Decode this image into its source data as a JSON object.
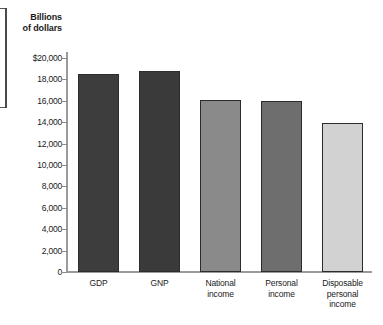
{
  "chart_data": {
    "type": "bar",
    "title": "Billions of dollars",
    "title_line1": "Billions",
    "title_line2": "of dollars",
    "xlabel": "",
    "ylabel": "Billions of dollars",
    "ylim": [
      0,
      20000
    ],
    "grid": false,
    "legend": "none",
    "y_ticks": [
      {
        "value": 20000,
        "label": "$20,000"
      },
      {
        "value": 18000,
        "label": "18,000"
      },
      {
        "value": 16000,
        "label": "16,000"
      },
      {
        "value": 14000,
        "label": "14,000"
      },
      {
        "value": 12000,
        "label": "12,000"
      },
      {
        "value": 10000,
        "label": "10,000"
      },
      {
        "value": 8000,
        "label": "8,000"
      },
      {
        "value": 6000,
        "label": "6,000"
      },
      {
        "value": 4000,
        "label": "4,000"
      },
      {
        "value": 2000,
        "label": "2,000"
      },
      {
        "value": 0,
        "label": "0"
      }
    ],
    "categories": [
      "GDP",
      "GNP",
      "National income",
      "Personal income",
      "Disposable personal income"
    ],
    "category_label_lines": [
      [
        "GDP"
      ],
      [
        "GNP"
      ],
      [
        "National",
        "income"
      ],
      [
        "Personal",
        "income"
      ],
      [
        "Disposable",
        "personal",
        "income"
      ]
    ],
    "values": [
      18550,
      18750,
      16100,
      15950,
      13950
    ],
    "bar_colors": [
      "#3d3d3d",
      "#3a3a3a",
      "#8a8a8a",
      "#6e6e6e",
      "#d2d2d2"
    ],
    "bar_border_color": "#2c2c2c",
    "axis_color": "#9a9a9a",
    "background": "#ffffff",
    "bars": [
      {
        "category": "GDP",
        "value": 18550,
        "color": "#3d3d3d"
      },
      {
        "category": "GNP",
        "value": 18750,
        "color": "#3a3a3a"
      },
      {
        "category": "National income",
        "value": 16100,
        "color": "#8a8a8a"
      },
      {
        "category": "Personal income",
        "value": 15950,
        "color": "#6e6e6e"
      },
      {
        "category": "Disposable personal income",
        "value": 13950,
        "color": "#d2d2d2"
      }
    ]
  }
}
